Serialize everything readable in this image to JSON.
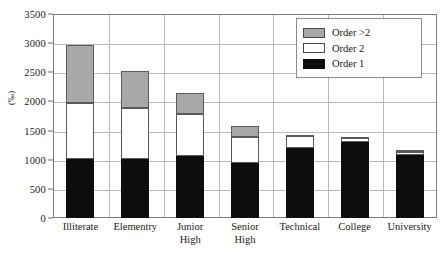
{
  "chart_data": {
    "type": "bar",
    "title": "",
    "subtitle": "",
    "xlabel": "",
    "ylabel": "(‰)",
    "ylim": [
      0,
      3500
    ],
    "ytick_step": 500,
    "yticks": [
      0,
      500,
      1000,
      1500,
      2000,
      2500,
      3000,
      3500
    ],
    "ytick_labels": [
      "0",
      "500",
      "1000",
      "1500",
      "2000",
      "2500",
      "3000",
      "3500"
    ],
    "grid": "horizontal-and-vertical",
    "stacked": true,
    "legend_position": "top-right",
    "categories": [
      "Illiterate",
      "Elementry",
      "Junior\nHigh",
      "Senior\nHigh",
      "Technical",
      "College",
      "University"
    ],
    "series": [
      {
        "name": "Order 1",
        "color": "#0d0d0d",
        "values": [
          1010,
          1020,
          1070,
          950,
          1200,
          1300,
          1075
        ]
      },
      {
        "name": "Order 2",
        "color": "#ffffff",
        "values": [
          960,
          870,
          720,
          440,
          200,
          90,
          55
        ]
      },
      {
        "name": "Order >2",
        "color": "#a8a8a8",
        "values": [
          1000,
          635,
          360,
          190,
          30,
          5,
          30
        ]
      }
    ],
    "totals": [
      2970,
      2525,
      2150,
      1580,
      1430,
      1395,
      1160
    ]
  },
  "legend": {
    "items": [
      {
        "label": "Order >2",
        "swatch": "gray-swatch"
      },
      {
        "label": "Order 2",
        "swatch": "white-swatch"
      },
      {
        "label": "Order 1",
        "swatch": "black-swatch"
      }
    ]
  }
}
